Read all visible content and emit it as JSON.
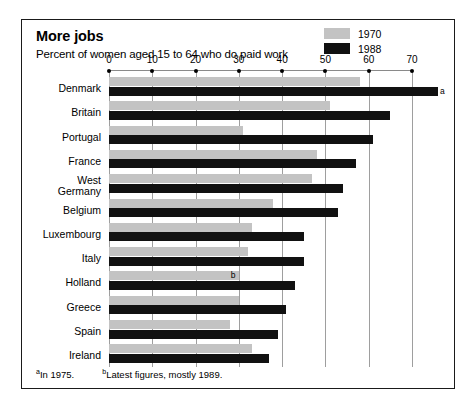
{
  "figure": {
    "title": "More jobs",
    "subtitle": "Percent of women aged 15 to 64 who do paid work"
  },
  "legend": {
    "position": "top-right",
    "items": [
      {
        "label": "1970",
        "color": "#c3c3c3",
        "swatch_name": "legend-swatch-1970"
      },
      {
        "label": "1988",
        "color": "#111111",
        "swatch_name": "legend-swatch-1988"
      }
    ]
  },
  "footnotes": [
    {
      "marker": "a",
      "text": "In 1975."
    },
    {
      "marker": "b",
      "text": "Latest figures, mostly 1989."
    }
  ],
  "annotations": [
    {
      "id": "a",
      "label": "a",
      "category": "Denmark",
      "series": "1988"
    },
    {
      "id": "b",
      "label": "b",
      "category": "Holland",
      "series": "1970"
    }
  ],
  "chart_data": {
    "type": "bar",
    "orientation": "horizontal",
    "title": "More jobs",
    "subtitle": "Percent of women aged 15 to 64 who do paid work",
    "xlabel": "",
    "ylabel": "",
    "xlim": [
      0,
      77
    ],
    "ticks": [
      0,
      10,
      20,
      30,
      40,
      50,
      60,
      70
    ],
    "tick_labels": [
      "0",
      "10",
      "20",
      "30",
      "40",
      "50",
      "60",
      "70"
    ],
    "grid": true,
    "grid_axis": "x",
    "legend_position": "top-right",
    "categories": [
      "Denmark",
      "Britain",
      "Portugal",
      "France",
      "West Germany",
      "Belgium",
      "Luxembourg",
      "Italy",
      "Holland",
      "Greece",
      "Spain",
      "Ireland"
    ],
    "series": [
      {
        "name": "1970",
        "color": "#c3c3c3",
        "values": [
          58,
          51,
          31,
          48,
          47,
          38,
          33,
          32,
          30,
          30,
          28,
          33
        ]
      },
      {
        "name": "1988",
        "color": "#111111",
        "values": [
          76,
          65,
          61,
          57,
          54,
          53,
          45,
          45,
          43,
          41,
          39,
          37
        ]
      }
    ]
  }
}
